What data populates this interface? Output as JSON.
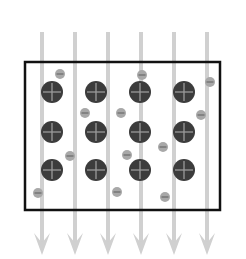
{
  "diagram": {
    "title": "",
    "width": 246,
    "height": 259,
    "colors": {
      "background": "#ffffff",
      "box_stroke": "#111111",
      "arrow": "#d0d0d0",
      "positive_ion_fill": "#3c3c3c",
      "positive_ion_sign": "#9a9a9a",
      "negative_ion_fill": "#a8a8a8",
      "negative_ion_sign": "#6a6a6a"
    },
    "box": {
      "x": 25,
      "y": 62,
      "width": 195,
      "height": 148,
      "stroke_width": 2.5
    },
    "arrows": {
      "direction": "down",
      "y_start": 32,
      "y_end": 255,
      "x": [
        42,
        75,
        108,
        141,
        174,
        207
      ]
    },
    "positive_ions": {
      "label": "+",
      "radius": 11,
      "items": [
        {
          "x": 52,
          "y": 92
        },
        {
          "x": 96,
          "y": 92
        },
        {
          "x": 140,
          "y": 92
        },
        {
          "x": 184,
          "y": 92
        },
        {
          "x": 52,
          "y": 132
        },
        {
          "x": 96,
          "y": 132
        },
        {
          "x": 140,
          "y": 132
        },
        {
          "x": 184,
          "y": 132
        },
        {
          "x": 52,
          "y": 170
        },
        {
          "x": 96,
          "y": 170
        },
        {
          "x": 140,
          "y": 170
        },
        {
          "x": 184,
          "y": 170
        }
      ]
    },
    "negative_ions": {
      "label": "−",
      "radius": 5,
      "items": [
        {
          "x": 60,
          "y": 74
        },
        {
          "x": 142,
          "y": 75
        },
        {
          "x": 210,
          "y": 82
        },
        {
          "x": 85,
          "y": 113
        },
        {
          "x": 121,
          "y": 113
        },
        {
          "x": 201,
          "y": 115
        },
        {
          "x": 70,
          "y": 156
        },
        {
          "x": 127,
          "y": 155
        },
        {
          "x": 163,
          "y": 147
        },
        {
          "x": 38,
          "y": 193
        },
        {
          "x": 117,
          "y": 192
        },
        {
          "x": 165,
          "y": 197
        }
      ]
    }
  }
}
